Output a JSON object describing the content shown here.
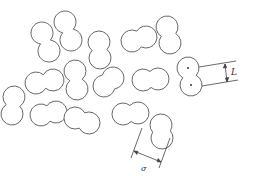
{
  "figure": {
    "stroke_color": "#555555",
    "labels": {
      "bond_length": "L",
      "diameter": "σ"
    }
  },
  "particles": [
    {
      "a": [
        42,
        33
      ],
      "b": [
        49,
        51
      ]
    },
    {
      "a": [
        65,
        22
      ],
      "b": [
        71,
        40
      ]
    },
    {
      "a": [
        99,
        42
      ],
      "b": [
        100,
        58
      ]
    },
    {
      "a": [
        132,
        41
      ],
      "b": [
        146,
        37
      ]
    },
    {
      "a": [
        167,
        27
      ],
      "b": [
        170,
        43
      ]
    },
    {
      "a": [
        36,
        83
      ],
      "b": [
        53,
        80
      ]
    },
    {
      "a": [
        75,
        71
      ],
      "b": [
        77,
        89
      ]
    },
    {
      "a": [
        104,
        86
      ],
      "b": [
        113,
        78
      ]
    },
    {
      "a": [
        143,
        80
      ],
      "b": [
        158,
        79
      ]
    },
    {
      "a": [
        41,
        115
      ],
      "b": [
        56,
        112
      ]
    },
    {
      "a": [
        75,
        118
      ],
      "b": [
        89,
        123
      ]
    },
    {
      "a": [
        123,
        114
      ],
      "b": [
        138,
        113
      ]
    },
    {
      "a": [
        161,
        125
      ],
      "b": [
        162,
        138
      ]
    },
    {
      "a": [
        12,
        114
      ],
      "b": [
        14,
        97
      ]
    },
    {
      "a": [
        188,
        68
      ],
      "b": [
        191,
        85
      ]
    }
  ],
  "radius": 11
}
